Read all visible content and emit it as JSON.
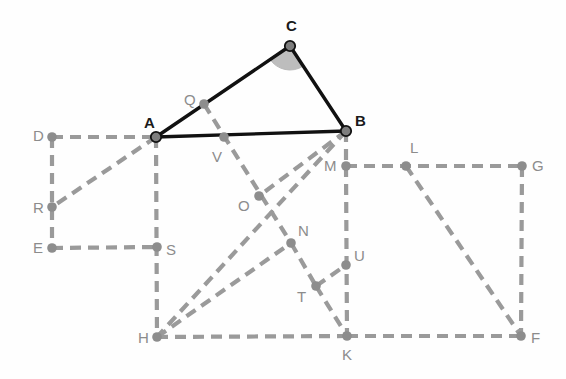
{
  "figure": {
    "canvas": {
      "width": 566,
      "height": 379
    },
    "colors": {
      "background": "#fefefe",
      "primary_stroke": "#111111",
      "auxiliary_stroke": "#9a9a9a",
      "vertex_fill": "#8d8d8d",
      "vertex_primary_fill": "#7d7d7d",
      "vertex_primary_stroke": "#111111",
      "angle_fill": "#b9b9b9",
      "label_primary": "#1a1a1a",
      "label_auxiliary": "#8c8c8c"
    },
    "dash_pattern": "11 7",
    "points": [
      {
        "id": "A",
        "label": "A",
        "x": 156,
        "y": 137,
        "kind": "primary",
        "label_dx": -12,
        "label_dy": -22
      },
      {
        "id": "B",
        "label": "B",
        "x": 346,
        "y": 131,
        "kind": "primary",
        "label_dx": 9,
        "label_dy": -18
      },
      {
        "id": "C",
        "label": "C",
        "x": 290,
        "y": 46,
        "kind": "primary",
        "label_dx": -4,
        "label_dy": -28
      },
      {
        "id": "D",
        "label": "D",
        "x": 52,
        "y": 137,
        "kind": "auxiliary",
        "label_dx": -19,
        "label_dy": -9
      },
      {
        "id": "E",
        "label": "E",
        "x": 52,
        "y": 248,
        "kind": "auxiliary",
        "label_dx": -19,
        "label_dy": -8
      },
      {
        "id": "F",
        "label": "F",
        "x": 521,
        "y": 336,
        "kind": "auxiliary",
        "label_dx": 10,
        "label_dy": -6
      },
      {
        "id": "G",
        "label": "G",
        "x": 522,
        "y": 166,
        "kind": "auxiliary",
        "label_dx": 10,
        "label_dy": -8
      },
      {
        "id": "H",
        "label": "H",
        "x": 157,
        "y": 337,
        "kind": "auxiliary",
        "label_dx": -19,
        "label_dy": -7
      },
      {
        "id": "K",
        "label": "K",
        "x": 347,
        "y": 336,
        "kind": "auxiliary",
        "label_dx": -5,
        "label_dy": 11
      },
      {
        "id": "L",
        "label": "L",
        "x": 406,
        "y": 166,
        "kind": "auxiliary",
        "label_dx": 4,
        "label_dy": -26
      },
      {
        "id": "M",
        "label": "M",
        "x": 346,
        "y": 166,
        "kind": "auxiliary",
        "label_dx": -22,
        "label_dy": -8
      },
      {
        "id": "N",
        "label": "N",
        "x": 291,
        "y": 243,
        "kind": "auxiliary",
        "label_dx": 7,
        "label_dy": -20
      },
      {
        "id": "O",
        "label": "O",
        "x": 259,
        "y": 196,
        "kind": "auxiliary",
        "label_dx": -21,
        "label_dy": 2
      },
      {
        "id": "Q",
        "label": "Q",
        "x": 204,
        "y": 104,
        "kind": "auxiliary",
        "label_dx": -20,
        "label_dy": -12
      },
      {
        "id": "R",
        "label": "R",
        "x": 52,
        "y": 207,
        "kind": "auxiliary",
        "label_dx": -19,
        "label_dy": -7
      },
      {
        "id": "S",
        "label": "S",
        "x": 157,
        "y": 247,
        "kind": "auxiliary",
        "label_dx": 9,
        "label_dy": -5
      },
      {
        "id": "T",
        "label": "T",
        "x": 316,
        "y": 286,
        "kind": "auxiliary",
        "label_dx": -19,
        "label_dy": 3
      },
      {
        "id": "U",
        "label": "U",
        "x": 346,
        "y": 265,
        "kind": "auxiliary",
        "label_dx": 8,
        "label_dy": -17
      },
      {
        "id": "V",
        "label": "V",
        "x": 224,
        "y": 137,
        "kind": "auxiliary",
        "label_dx": -12,
        "label_dy": 12
      }
    ],
    "primary_edges": [
      {
        "id": "edge-AB",
        "from": "A",
        "to": "B"
      },
      {
        "id": "edge-AC",
        "from": "A",
        "to": "C"
      },
      {
        "id": "edge-CB",
        "from": "C",
        "to": "B"
      }
    ],
    "auxiliary_edges": [
      {
        "id": "edge-DA",
        "from": "D",
        "to": "A"
      },
      {
        "id": "edge-DE",
        "from": "D",
        "to": "E"
      },
      {
        "id": "edge-ES",
        "from": "E",
        "to": "S"
      },
      {
        "id": "edge-AH",
        "from": "A",
        "to": "H"
      },
      {
        "id": "edge-AR",
        "from": "A",
        "to": "R"
      },
      {
        "id": "edge-QN",
        "from": "Q",
        "to": "N"
      },
      {
        "id": "edge-BH",
        "from": "B",
        "to": "H"
      },
      {
        "id": "edge-BM",
        "from": "B",
        "to": "M"
      },
      {
        "id": "edge-BO",
        "from": "B",
        "to": "O"
      },
      {
        "id": "edge-MG",
        "from": "M",
        "to": "G"
      },
      {
        "id": "edge-GF",
        "from": "G",
        "to": "F"
      },
      {
        "id": "edge-MK",
        "from": "M",
        "to": "K"
      },
      {
        "id": "edge-HK",
        "from": "H",
        "to": "K"
      },
      {
        "id": "edge-KF",
        "from": "K",
        "to": "F"
      },
      {
        "id": "edge-LF",
        "from": "L",
        "to": "F"
      },
      {
        "id": "edge-HN",
        "from": "H",
        "to": "N"
      },
      {
        "id": "edge-NT",
        "from": "N",
        "to": "T"
      },
      {
        "id": "edge-TK",
        "from": "T",
        "to": "K"
      },
      {
        "id": "edge-TU",
        "from": "T",
        "to": "U"
      }
    ],
    "angle_marks": [
      {
        "id": "angle-C",
        "at": "C",
        "radius": 24,
        "start_deg": 148,
        "end_deg": 57
      }
    ]
  }
}
